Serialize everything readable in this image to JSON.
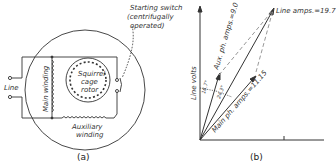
{
  "panel_a": {
    "caption": "(a)",
    "starting_switch_line1": "Starting switch",
    "starting_switch_line2": "(centrifugally",
    "starting_switch_line3": "operated)",
    "rotor_line1": "Squirrel",
    "rotor_line2": "cage",
    "rotor_line3": "rotor",
    "line_label": "Line",
    "main_winding": "Main winding",
    "aux_line1": "Auxiliary",
    "aux_line2": "winding"
  },
  "panel_b": {
    "caption": "(b)",
    "y_axis_label": "Line volts",
    "line_amps": "Line amps.=19.7",
    "aux_amps": "Aux. ph. amps.=9.0",
    "main_amps": "Main ph. amps.=11.15",
    "angle_aux": "16.7°",
    "angle_main": "24.3°"
  },
  "colors": {
    "ink": "#333333",
    "dashed": "#999999"
  }
}
